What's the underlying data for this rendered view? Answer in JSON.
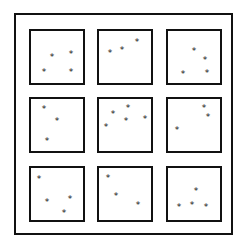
{
  "figure": {
    "marker_glyph": "*",
    "line_color": "#111111",
    "background_color": "#ffffff",
    "panels": [
      {
        "row": 0,
        "col": 0,
        "left": 29,
        "top": 29,
        "stars": [
          [
            52,
            56
          ],
          [
            71,
            53
          ],
          [
            44,
            71
          ],
          [
            71,
            71
          ]
        ]
      },
      {
        "row": 0,
        "col": 1,
        "left": 97,
        "top": 29,
        "stars": [
          [
            110,
            52
          ],
          [
            122,
            49
          ],
          [
            137,
            41
          ]
        ]
      },
      {
        "row": 0,
        "col": 2,
        "left": 166,
        "top": 29,
        "stars": [
          [
            194,
            50
          ],
          [
            205,
            59
          ],
          [
            183,
            73
          ],
          [
            207,
            72
          ]
        ]
      },
      {
        "row": 1,
        "col": 0,
        "left": 29,
        "top": 97,
        "stars": [
          [
            44,
            108
          ],
          [
            57,
            120
          ],
          [
            47,
            140
          ]
        ]
      },
      {
        "row": 1,
        "col": 1,
        "left": 97,
        "top": 97,
        "stars": [
          [
            113,
            113
          ],
          [
            128,
            107
          ],
          [
            126,
            120
          ],
          [
            145,
            118
          ],
          [
            106,
            126
          ]
        ]
      },
      {
        "row": 1,
        "col": 2,
        "left": 166,
        "top": 97,
        "stars": [
          [
            204,
            107
          ],
          [
            208,
            116
          ],
          [
            177,
            129
          ]
        ]
      },
      {
        "row": 2,
        "col": 0,
        "left": 29,
        "top": 166,
        "stars": [
          [
            39,
            178
          ],
          [
            47,
            201
          ],
          [
            70,
            198
          ],
          [
            64,
            212
          ]
        ]
      },
      {
        "row": 2,
        "col": 1,
        "left": 97,
        "top": 166,
        "stars": [
          [
            108,
            177
          ],
          [
            116,
            195
          ],
          [
            138,
            204
          ]
        ]
      },
      {
        "row": 2,
        "col": 2,
        "left": 166,
        "top": 166,
        "stars": [
          [
            196,
            190
          ],
          [
            179,
            206
          ],
          [
            192,
            204
          ],
          [
            206,
            206
          ]
        ]
      }
    ]
  }
}
